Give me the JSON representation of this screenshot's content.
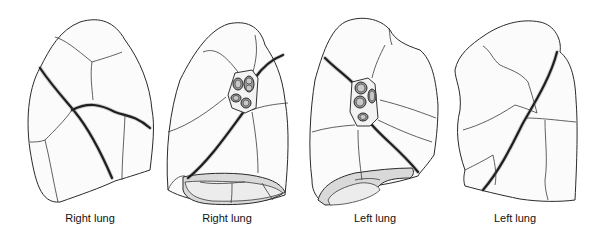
{
  "figure": {
    "panels": [
      {
        "id": "panel-1",
        "label": "Right lung",
        "view": "lateral"
      },
      {
        "id": "panel-2",
        "label": "Right lung",
        "view": "medial"
      },
      {
        "id": "panel-3",
        "label": "Left lung",
        "view": "medial"
      },
      {
        "id": "panel-4",
        "label": "Left lung",
        "view": "lateral"
      }
    ],
    "colors": {
      "background": "#ffffff",
      "outline": "#2a2a2a",
      "fill": "#fbfbfb",
      "diaphragm_surface": "#d9d9d9"
    }
  }
}
